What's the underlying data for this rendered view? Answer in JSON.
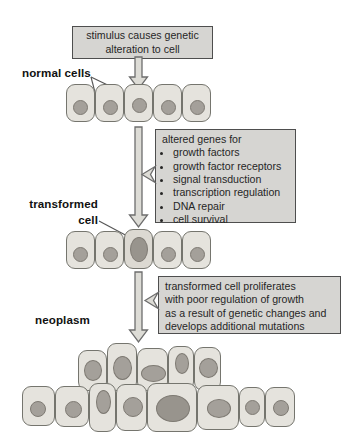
{
  "diagram": {
    "stimulus_box": "stimulus causes genetic alteration to cell",
    "altered_genes_box": {
      "heading": "altered genes for",
      "bullets": [
        "growth factors",
        "growth factor receptors",
        "signal transduction",
        "transcription regulation",
        "DNA repair",
        "cell survival"
      ]
    },
    "proliferation_box": {
      "lines": [
        "transformed cell proliferates",
        "with poor regulation of growth",
        "as a result of genetic changes and",
        "develops additional mutations"
      ]
    },
    "labels": {
      "normal_cells": "normal cells",
      "transformed_cell": "transformed cell",
      "neoplasm": "neoplasm"
    },
    "stages": [
      {
        "name": "normal cells",
        "cell_count": 5
      },
      {
        "name": "transformed cell",
        "cell_count": 5,
        "note": "middle cell has enlarged oval nucleus"
      },
      {
        "name": "neoplasm",
        "cell_count": 13,
        "note": "disorganized two-layer cluster with enlarged irregular nuclei"
      }
    ],
    "colors": {
      "background": "#ffffff",
      "box_fill": "#d6d5d2",
      "box_border": "#4e4e4e",
      "text": "#262626",
      "cell_fill": "#e5e3dd",
      "cell_fill_alt": "#dcd9d2",
      "cell_border": "#75756e",
      "nucleus_fill": "#a4a09a",
      "nucleus_fill_dark": "#98948d",
      "nucleus_border": "#7e7a73",
      "arrow_fill": "#dddcd6",
      "arrow_border": "#6d6d6d",
      "line_color": "#555555"
    }
  }
}
